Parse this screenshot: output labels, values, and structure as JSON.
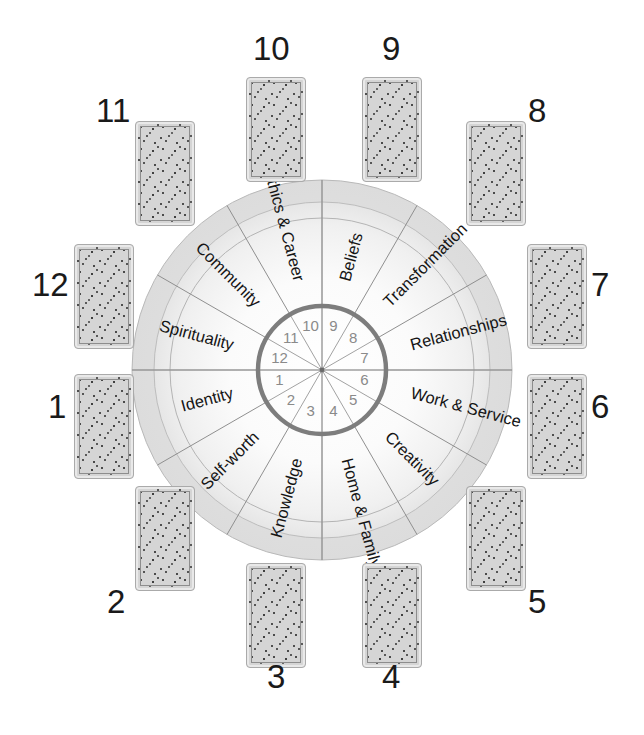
{
  "figure": {
    "type": "diagram",
    "center": {
      "x": 322,
      "y": 370
    },
    "colors": {
      "card_fill": "#d5d5d5",
      "card_border": "#e9e9e9",
      "card_speckle": "#4a4a4a",
      "ring_band": "#e2e2e2",
      "wheel_glow": "#f6f6f6",
      "hub_ring": "#7d7d7d",
      "spoke_line": "#8f8f8f",
      "label_text": "#151515",
      "hub_number": "#8a8a8a",
      "position_number": "#1a1a1a",
      "background": "#ffffff"
    }
  },
  "wheel": {
    "outer_radius": 190,
    "band_inner_radius": 168,
    "sector_arc_radius": 152,
    "hub_radius": 64,
    "sector_count": 12,
    "hub_numbers": [
      "1",
      "2",
      "3",
      "4",
      "5",
      "6",
      "7",
      "8",
      "9",
      "10",
      "11",
      "12"
    ],
    "sectors": [
      {
        "house": 1,
        "label": "Identity",
        "hub_number": "1"
      },
      {
        "house": 2,
        "label": "Self-worth",
        "hub_number": "2"
      },
      {
        "house": 3,
        "label": "Knowledge",
        "hub_number": "3"
      },
      {
        "house": 4,
        "label": "Home & Family",
        "hub_number": "4"
      },
      {
        "house": 5,
        "label": "Creativity",
        "hub_number": "5"
      },
      {
        "house": 6,
        "label": "Work & Service",
        "hub_number": "6"
      },
      {
        "house": 7,
        "label": "Relationships",
        "hub_number": "7"
      },
      {
        "house": 8,
        "label": "Transformation",
        "hub_number": "8"
      },
      {
        "house": 9,
        "label": "Beliefs",
        "hub_number": "9"
      },
      {
        "house": 10,
        "label": "Ethics & Career",
        "hub_number": "10"
      },
      {
        "house": 11,
        "label": "Community",
        "hub_number": "11"
      },
      {
        "house": 12,
        "label": "Spirituality",
        "hub_number": "12"
      }
    ]
  },
  "cards": [
    {
      "number": "1",
      "card_x": 75,
      "card_y": 375,
      "num_x": 48,
      "num_y": 390
    },
    {
      "number": "2",
      "card_x": 136,
      "card_y": 487,
      "num_x": 107,
      "num_y": 585
    },
    {
      "number": "3",
      "card_x": 247,
      "card_y": 564,
      "num_x": 267,
      "num_y": 660
    },
    {
      "number": "4",
      "card_x": 363,
      "card_y": 564,
      "num_x": 382,
      "num_y": 660
    },
    {
      "number": "5",
      "card_x": 467,
      "card_y": 487,
      "num_x": 528,
      "num_y": 585
    },
    {
      "number": "6",
      "card_x": 528,
      "card_y": 375,
      "num_x": 591,
      "num_y": 390
    },
    {
      "number": "7",
      "card_x": 528,
      "card_y": 245,
      "num_x": 591,
      "num_y": 268
    },
    {
      "number": "8",
      "card_x": 467,
      "card_y": 122,
      "num_x": 528,
      "num_y": 94
    },
    {
      "number": "9",
      "card_x": 363,
      "card_y": 78,
      "num_x": 382,
      "num_y": 32
    },
    {
      "number": "10",
      "card_x": 247,
      "card_y": 78,
      "num_x": 253,
      "num_y": 32
    },
    {
      "number": "11",
      "card_x": 136,
      "card_y": 122,
      "num_x": 96,
      "num_y": 94
    },
    {
      "number": "12",
      "card_x": 75,
      "card_y": 245,
      "num_x": 32,
      "num_y": 268
    }
  ],
  "card_size": {
    "width": 58,
    "height": 103
  }
}
